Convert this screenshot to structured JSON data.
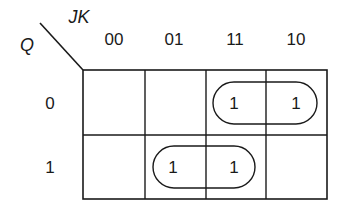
{
  "kmap": {
    "row_variable": "Q",
    "col_variable": "JK",
    "col_headers": [
      "00",
      "01",
      "11",
      "10"
    ],
    "row_headers": [
      "0",
      "1"
    ],
    "cells": [
      [
        "",
        "",
        "1",
        "1"
      ],
      [
        "",
        "1",
        "1",
        ""
      ]
    ],
    "groups": [
      {
        "row": 0,
        "cols": [
          2,
          3
        ]
      },
      {
        "row": 1,
        "cols": [
          1,
          2
        ]
      }
    ],
    "line_color": "#1a1a1a"
  }
}
